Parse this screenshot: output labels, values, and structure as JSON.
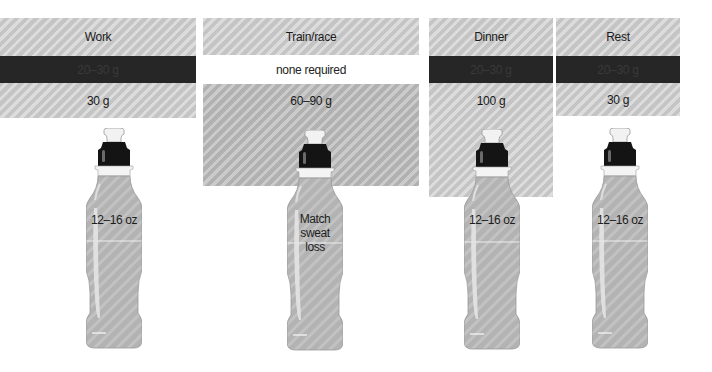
{
  "colors": {
    "panel_fill": "#cfcfcf",
    "panel_fill_darker": "#bcbcbc",
    "dark_band": "#262626",
    "white_band": "#ffffff",
    "cap": "#111111",
    "bottle_fill": "#b5b5b5"
  },
  "columns": [
    {
      "name": "Work",
      "row_dark": "20–30 g",
      "row_amount": "30 g",
      "bottle_label": "12–16 oz"
    },
    {
      "name": "Train/race",
      "row_white": "none required",
      "row_amount": "60–90 g",
      "bottle_label": "Match sweat loss"
    },
    {
      "name": "Dinner",
      "row_dark": "20–30 g",
      "row_amount": "100 g",
      "bottle_label": "12–16 oz"
    },
    {
      "name": "Rest",
      "row_dark": "20–30 g",
      "row_amount": "30 g",
      "bottle_label": "12–16 oz"
    }
  ],
  "icons": [
    "sports-bottle-icon"
  ]
}
